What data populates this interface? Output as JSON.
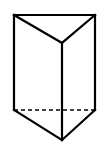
{
  "diagram": {
    "type": "triangular-prism",
    "stroke_color": "#000000",
    "background_color": "#ffffff",
    "vertices": {
      "top_back_left": [
        14,
        15
      ],
      "top_back_right": [
        95,
        15
      ],
      "top_front": [
        62,
        43
      ],
      "bottom_back_left": [
        14,
        110
      ],
      "bottom_back_right": [
        95,
        110
      ],
      "bottom_front": [
        62,
        140
      ]
    },
    "solid_edges": [
      [
        "top_back_left",
        "top_back_right"
      ],
      [
        "top_back_left",
        "top_front"
      ],
      [
        "top_back_right",
        "top_front"
      ],
      [
        "top_back_left",
        "bottom_back_left"
      ],
      [
        "top_back_right",
        "bottom_back_right"
      ],
      [
        "top_front",
        "bottom_front"
      ],
      [
        "bottom_back_left",
        "bottom_front"
      ],
      [
        "bottom_back_right",
        "bottom_front"
      ]
    ],
    "hidden_edges": [
      [
        "bottom_back_left",
        "bottom_back_right"
      ]
    ]
  }
}
